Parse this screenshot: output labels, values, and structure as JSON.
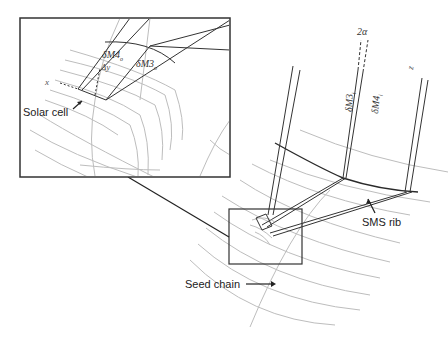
{
  "figure": {
    "labels": {
      "solar_cell": "Solar cell",
      "sms_rib": "SMS rib",
      "seed_chain": "Seed chain",
      "two_alpha": "2α",
      "dM3_o": "δM3",
      "dM3_o_sub": "o",
      "dM4_o": "δM4",
      "dM4_o_sub": "o",
      "dM3_i": "δM3",
      "dM3_i_sub": "i",
      "dM4_i": "δM4",
      "dM4_i_sub": "i",
      "x_axis": "x",
      "z_axis": "z",
      "delta_y": "Δy"
    },
    "colors": {
      "grid_lines": "#bdbdbd",
      "rays": "#333333",
      "frame": "#333333",
      "background": "#ffffff"
    }
  }
}
